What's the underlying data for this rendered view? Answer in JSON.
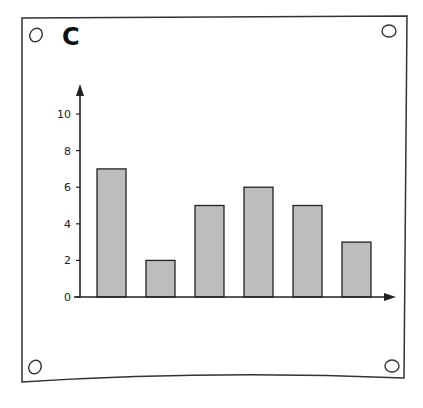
{
  "panel": {
    "label": "C"
  },
  "colors": {
    "bar_fill": "#bdbdbd",
    "bar_stroke": "#222222",
    "axis": "#222222",
    "frame": "#333333"
  },
  "chart_data": {
    "type": "bar",
    "title": "",
    "panel_label": "C",
    "categories": [
      "1",
      "2",
      "3",
      "4",
      "5",
      "6"
    ],
    "values": [
      7,
      2,
      5,
      6,
      5,
      3
    ],
    "xlabel": "",
    "ylabel": "",
    "ylim": [
      0,
      11
    ],
    "yticks": [
      0,
      2,
      4,
      6,
      8,
      10
    ],
    "grid": false,
    "legend": null
  },
  "axis": {
    "ticks": [
      "0",
      "2",
      "4",
      "6",
      "8",
      "10"
    ]
  }
}
